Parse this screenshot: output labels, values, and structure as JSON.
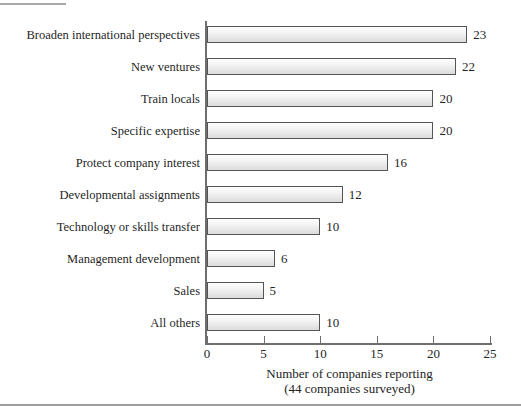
{
  "chart_data": {
    "type": "bar",
    "orientation": "horizontal",
    "title": "",
    "xlabel": "Number of companies reporting",
    "xlabel_sub": "(44 companies surveyed)",
    "ylabel": "",
    "xlim": [
      0,
      25
    ],
    "xticks": [
      0,
      5,
      10,
      15,
      20,
      25
    ],
    "xtick_labels": [
      "0",
      "5",
      "10",
      "15",
      "20",
      "25"
    ],
    "grid": false,
    "legend": false,
    "categories": [
      "Broaden international perspectives",
      "New ventures",
      "Train locals",
      "Specific expertise",
      "Protect company interest",
      "Developmental assignments",
      "Technology or skills transfer",
      "Management development",
      "Sales",
      "All others"
    ],
    "values": [
      23,
      22,
      20,
      20,
      16,
      12,
      10,
      6,
      5,
      10
    ],
    "value_labels": [
      "23",
      "22",
      "20",
      "20",
      "16",
      "12",
      "10",
      "6",
      "5",
      "10"
    ],
    "bar_fill_color": "#eeeeee",
    "bar_border_color": "#555555",
    "axis_color": "#6e6e6e",
    "text_color": "#232323",
    "background_color": "#ffffff"
  }
}
